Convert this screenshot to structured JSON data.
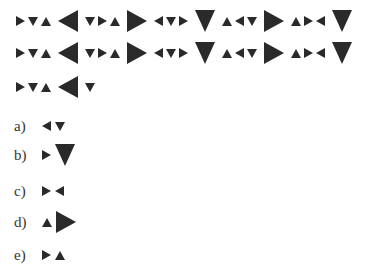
{
  "question": {
    "sequence_rows": [
      [
        [
          "s-right",
          "s-down",
          "s-up"
        ],
        [
          "b-left"
        ],
        [
          "s-down",
          "s-right",
          "s-up"
        ],
        [
          "b-right"
        ],
        [
          "s-left",
          "s-down",
          "s-right"
        ],
        [
          "b-down"
        ],
        [
          "s-up",
          "s-left",
          "s-down"
        ],
        [
          "b-right"
        ],
        [
          "s-up",
          "s-right",
          "s-left"
        ],
        [
          "b-down"
        ]
      ],
      [
        [
          "s-right",
          "s-down",
          "s-up"
        ],
        [
          "b-left"
        ],
        [
          "s-down",
          "s-right",
          "s-up"
        ],
        [
          "b-right"
        ],
        [
          "s-left",
          "s-down",
          "s-right"
        ],
        [
          "b-down"
        ],
        [
          "s-up",
          "s-left",
          "s-down"
        ],
        [
          "b-right"
        ],
        [
          "s-up",
          "s-right",
          "s-left"
        ],
        [
          "b-down"
        ]
      ],
      [
        [
          "s-right",
          "s-down",
          "s-up"
        ],
        [
          "b-left"
        ],
        [
          "s-down"
        ]
      ]
    ]
  },
  "options": [
    {
      "label": "a)",
      "shapes": [
        "s-left",
        "s-down"
      ]
    },
    {
      "label": "b)",
      "shapes": [
        "s-right",
        "b-down"
      ]
    },
    {
      "label": "c)",
      "shapes": [
        "s-right",
        "s-left"
      ]
    },
    {
      "label": "d)",
      "shapes": [
        "s-up",
        "b-right"
      ]
    },
    {
      "label": "e)",
      "shapes": [
        "s-right",
        "s-up"
      ]
    }
  ],
  "colors": {
    "shape": "#2a2a2a",
    "background": "#ffffff"
  }
}
